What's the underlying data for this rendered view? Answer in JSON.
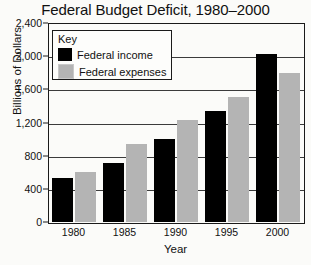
{
  "chart_data": {
    "type": "bar",
    "title": "Federal Budget Deficit, 1980–2000",
    "xlabel": "Year",
    "ylabel": "Billions of Dollars",
    "categories": [
      "1980",
      "1985",
      "1990",
      "1995",
      "2000"
    ],
    "series": [
      {
        "name": "Federal income",
        "color": "#000000",
        "values": [
          530,
          710,
          1000,
          1340,
          2030
        ]
      },
      {
        "name": "Federal expenses",
        "color": "#b4b4b4",
        "values": [
          600,
          940,
          1230,
          1510,
          1800
        ]
      }
    ],
    "ylim": [
      0,
      2400
    ],
    "ytick_step": 400,
    "ytick_labels": [
      "0",
      "400",
      "800",
      "1,200",
      "1,600",
      "2,000",
      "2,400"
    ],
    "grid": true,
    "legend_position": "inside-top-left"
  },
  "legend": {
    "title": "Key",
    "entries": [
      {
        "label": "Federal income",
        "color": "#000000"
      },
      {
        "label": "Federal expenses",
        "color": "#b4b4b4"
      }
    ]
  }
}
